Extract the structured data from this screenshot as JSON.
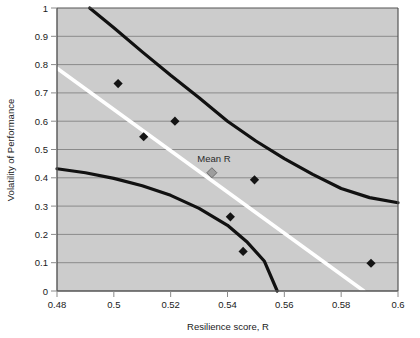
{
  "chart_data": {
    "type": "scatter",
    "title": "",
    "xlabel": "Resilience score, R",
    "ylabel": "Volatility of Performance",
    "xlim": [
      0.48,
      0.6
    ],
    "ylim": [
      0,
      1
    ],
    "xticks": [
      "0.48",
      "0.5",
      "0.52",
      "0.54",
      "0.56",
      "0.58",
      "0.6"
    ],
    "xtick_values": [
      0.48,
      0.5,
      0.52,
      0.54,
      0.56,
      0.58,
      0.6
    ],
    "yticks": [
      "0",
      "0.1",
      "0.2",
      "0.3",
      "0.4",
      "0.5",
      "0.6",
      "0.7",
      "0.8",
      "0.9",
      "1"
    ],
    "ytick_values": [
      0,
      0.1,
      0.2,
      0.3,
      0.4,
      0.5,
      0.6,
      0.7,
      0.8,
      0.9,
      1
    ],
    "grid": "horizontal",
    "legend": "none",
    "plot_background": "#cccccc",
    "points": [
      {
        "x": 0.5015,
        "y": 0.733
      },
      {
        "x": 0.5105,
        "y": 0.545
      },
      {
        "x": 0.5215,
        "y": 0.6
      },
      {
        "x": 0.5345,
        "y": 0.418,
        "label": "Mean R",
        "marker": "diamond-gray"
      },
      {
        "x": 0.5495,
        "y": 0.393
      },
      {
        "x": 0.541,
        "y": 0.262
      },
      {
        "x": 0.5455,
        "y": 0.14
      },
      {
        "x": 0.5905,
        "y": 0.098
      }
    ],
    "series": [
      {
        "name": "upper confidence bound",
        "type": "curve",
        "color": "#111111",
        "points": [
          {
            "x": 0.4915,
            "y": 1.0
          },
          {
            "x": 0.5,
            "y": 0.93
          },
          {
            "x": 0.51,
            "y": 0.845
          },
          {
            "x": 0.52,
            "y": 0.762
          },
          {
            "x": 0.53,
            "y": 0.683
          },
          {
            "x": 0.54,
            "y": 0.6
          },
          {
            "x": 0.55,
            "y": 0.53
          },
          {
            "x": 0.56,
            "y": 0.468
          },
          {
            "x": 0.57,
            "y": 0.412
          },
          {
            "x": 0.58,
            "y": 0.362
          },
          {
            "x": 0.59,
            "y": 0.33
          },
          {
            "x": 0.6,
            "y": 0.312
          }
        ]
      },
      {
        "name": "regression line (mean)",
        "type": "line",
        "color": "#ffffff",
        "points": [
          {
            "x": 0.48,
            "y": 0.787
          },
          {
            "x": 0.588,
            "y": 0.0
          }
        ]
      },
      {
        "name": "lower confidence bound",
        "type": "curve",
        "color": "#111111",
        "points": [
          {
            "x": 0.48,
            "y": 0.432
          },
          {
            "x": 0.49,
            "y": 0.418
          },
          {
            "x": 0.5,
            "y": 0.398
          },
          {
            "x": 0.51,
            "y": 0.372
          },
          {
            "x": 0.52,
            "y": 0.338
          },
          {
            "x": 0.53,
            "y": 0.292
          },
          {
            "x": 0.54,
            "y": 0.232
          },
          {
            "x": 0.547,
            "y": 0.172
          },
          {
            "x": 0.553,
            "y": 0.105
          },
          {
            "x": 0.5575,
            "y": 0.0
          }
        ]
      }
    ],
    "annotations": [
      {
        "text": "Mean R",
        "x": 0.5345,
        "y": 0.418,
        "placement": "above"
      }
    ]
  }
}
